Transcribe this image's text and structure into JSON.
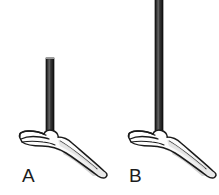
{
  "figure": {
    "type": "science-illustration",
    "background_color": "#ffffff",
    "width": 219,
    "height": 195
  },
  "panels": [
    {
      "id": "a",
      "label": "A",
      "rod": {
        "name": "short-rod",
        "color": "#2b2b2b",
        "highlight_color": "#6e6e6e",
        "edge_color": "#161616",
        "top_y": 58,
        "bottom_y": 140,
        "length_px": 82,
        "width_px": 8,
        "center_x": 50,
        "orientation": "vertical"
      },
      "hand": {
        "name": "open-palm-hand",
        "outline_color": "#1a1a1a",
        "fill_color": "#ffffff",
        "shadow_color": "#d8d8d8",
        "pose": "palm-up-horizontal",
        "balance_point_x": 50,
        "balance_point_y": 140
      }
    },
    {
      "id": "b",
      "label": "B",
      "rod": {
        "name": "long-rod",
        "color": "#2b2b2b",
        "highlight_color": "#6e6e6e",
        "edge_color": "#161616",
        "top_y": 0,
        "bottom_y": 140,
        "length_px": 140,
        "width_px": 8,
        "center_x": 50,
        "orientation": "vertical"
      },
      "hand": {
        "name": "open-palm-hand",
        "outline_color": "#1a1a1a",
        "fill_color": "#ffffff",
        "shadow_color": "#d8d8d8",
        "pose": "palm-up-horizontal",
        "balance_point_x": 50,
        "balance_point_y": 140
      }
    }
  ]
}
